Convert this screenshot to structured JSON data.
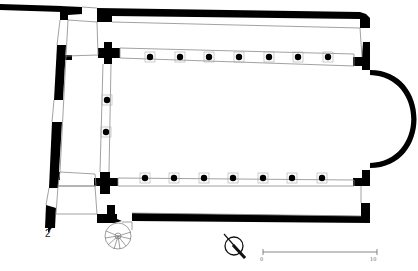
{
  "figure": {
    "label": "2",
    "type": "architectural floor plan"
  },
  "scale_bar": {
    "start_label": "0",
    "end_label": "10"
  },
  "north_arrow": {
    "icon": "north-arrow-icon"
  },
  "plan": {
    "north_colonnade_columns": 7,
    "south_colonnade_columns": 7,
    "narthex_columns": 2,
    "features": [
      "narthex",
      "nave",
      "north-aisle",
      "south-aisle",
      "apse",
      "spiral-staircase"
    ]
  },
  "colors": {
    "wall": "#000000",
    "outline": "#8a8a8a",
    "background": "#ffffff"
  }
}
